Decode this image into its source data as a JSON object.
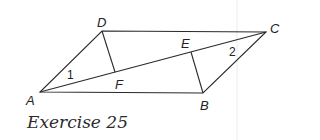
{
  "figure": {
    "caption": "Exercise 25",
    "vertices": {
      "A": {
        "label": "A",
        "x": 40,
        "y": 92
      },
      "B": {
        "label": "B",
        "x": 203,
        "y": 93
      },
      "C": {
        "label": "C",
        "x": 266,
        "y": 32
      },
      "D": {
        "label": "D",
        "x": 102,
        "y": 31
      },
      "E": {
        "label": "E",
        "x": 191,
        "y": 52
      },
      "F": {
        "label": "F",
        "x": 115,
        "y": 72
      }
    },
    "angle_labels": {
      "angle1": "1",
      "angle2": "2"
    },
    "segments": [
      "AB",
      "BC",
      "CD",
      "DA",
      "AC",
      "DF",
      "BE"
    ],
    "colors": {
      "stroke": "#2a2a2a",
      "guide": "#e6e6e6"
    }
  }
}
